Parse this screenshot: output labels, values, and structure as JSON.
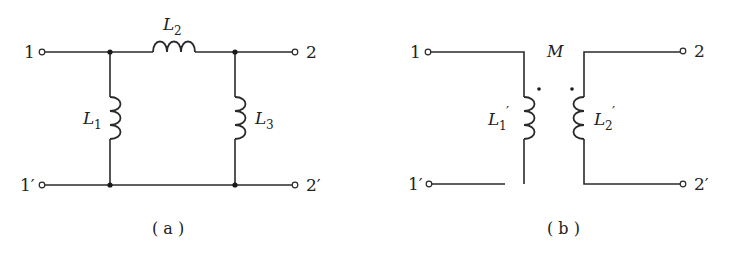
{
  "diagram_a": {
    "caption": "( a )",
    "terminals": {
      "t1": "1",
      "t1p": "1′",
      "t2": "2",
      "t2p": "2′"
    },
    "inductors": {
      "L1": {
        "name": "L",
        "sub": "1"
      },
      "L2": {
        "name": "L",
        "sub": "2"
      },
      "L3": {
        "name": "L",
        "sub": "3"
      }
    }
  },
  "diagram_b": {
    "caption": "( b )",
    "terminals": {
      "t1": "1",
      "t1p": "1′",
      "t2": "2",
      "t2p": "2′"
    },
    "mutual": "M",
    "inductors": {
      "L1p": {
        "name": "L",
        "sub": "1",
        "prime": "′"
      },
      "L2p": {
        "name": "L",
        "sub": "2",
        "prime": "′"
      }
    },
    "dot_markers": [
      "primary-top",
      "secondary-top"
    ]
  }
}
